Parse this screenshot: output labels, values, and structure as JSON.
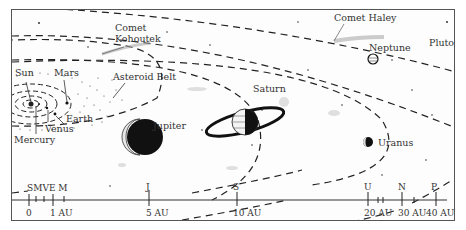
{
  "diagram": {
    "bodies": [
      {
        "name": "Sun",
        "label": "Sun"
      },
      {
        "name": "Mercury",
        "label": "Mercury"
      },
      {
        "name": "Venus",
        "label": "Venus"
      },
      {
        "name": "Earth",
        "label": "Earth"
      },
      {
        "name": "Mars",
        "label": "Mars"
      },
      {
        "name": "Asteroid Belt",
        "label": "Asteroid Belt"
      },
      {
        "name": "Jupiter",
        "label": "Jupiter"
      },
      {
        "name": "Saturn",
        "label": "Saturn"
      },
      {
        "name": "Uranus",
        "label": "Uranus"
      },
      {
        "name": "Neptune",
        "label": "Neptune"
      },
      {
        "name": "Pluto",
        "label": "Pluto"
      },
      {
        "name": "Comet Kohoutek",
        "label": "Comet\nKohoutek",
        "line1": "Comet",
        "line2": "Kohoutek"
      },
      {
        "name": "Comet Haley",
        "label": "Comet Haley"
      }
    ],
    "scale": {
      "markers": [
        "S",
        "M",
        "V",
        "E",
        "M",
        "J",
        "S",
        "U",
        "N",
        "P"
      ],
      "marker_labels": {
        "sm": "SMVE M",
        "j": "J",
        "s": "S",
        "u": "U",
        "n": "N",
        "p": "P"
      },
      "ticks": [
        "0",
        "1 AU",
        "5 AU",
        "10 AU",
        "20 AU",
        "30 AU",
        "40 AU"
      ]
    },
    "colors": {
      "ink": "#111111",
      "text": "#333333",
      "frame": "#555555",
      "background": "#fdfdfd"
    }
  }
}
